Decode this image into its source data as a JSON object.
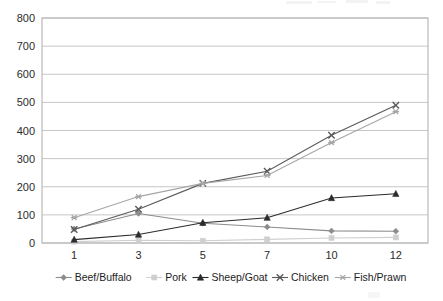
{
  "chart_data": {
    "type": "line",
    "title": "",
    "subtitle": "",
    "xlabel": "",
    "ylabel": "",
    "x": [
      "1",
      "3",
      "5",
      "7",
      "10",
      "12"
    ],
    "categories": [
      "1",
      "3",
      "5",
      "7",
      "10",
      "12"
    ],
    "ylim": [
      0,
      800
    ],
    "ytick_values": [
      0,
      100,
      200,
      300,
      400,
      500,
      600,
      700,
      800
    ],
    "ytick_labels": [
      "0",
      "100",
      "200",
      "300",
      "400",
      "500",
      "600",
      "700",
      "800"
    ],
    "grid": "horizontal",
    "legend_position": "bottom",
    "series": [
      {
        "name": "Beef/Buffalo",
        "marker": "diamond",
        "color": "#8c8c8c",
        "values": [
          50,
          105,
          70,
          57,
          43,
          42
        ]
      },
      {
        "name": "Pork",
        "marker": "square",
        "color": "#cfcfcf",
        "values": [
          5,
          10,
          8,
          13,
          18,
          20
        ]
      },
      {
        "name": "Sheep/Goat",
        "marker": "triangle",
        "color": "#2b2b2b",
        "values": [
          12,
          30,
          72,
          90,
          160,
          175
        ]
      },
      {
        "name": "Chicken",
        "marker": "cross",
        "color": "#5a5a5a",
        "values": [
          48,
          120,
          212,
          255,
          383,
          490
        ]
      },
      {
        "name": "Fish/Prawn",
        "marker": "asterisk",
        "color": "#a6a6a6",
        "values": [
          90,
          165,
          212,
          240,
          357,
          467
        ]
      }
    ]
  },
  "legend": {
    "items": [
      {
        "label": "Beef/Buffalo"
      },
      {
        "label": "Pork"
      },
      {
        "label": "Sheep/Goat"
      },
      {
        "label": "Chicken"
      },
      {
        "label": "Fish/Prawn"
      }
    ]
  },
  "colors": {
    "plot_border": "#b9b9b9",
    "gridline": "#c6c6c6",
    "axis_text": "#2b2b2b",
    "background": "#ffffff"
  }
}
